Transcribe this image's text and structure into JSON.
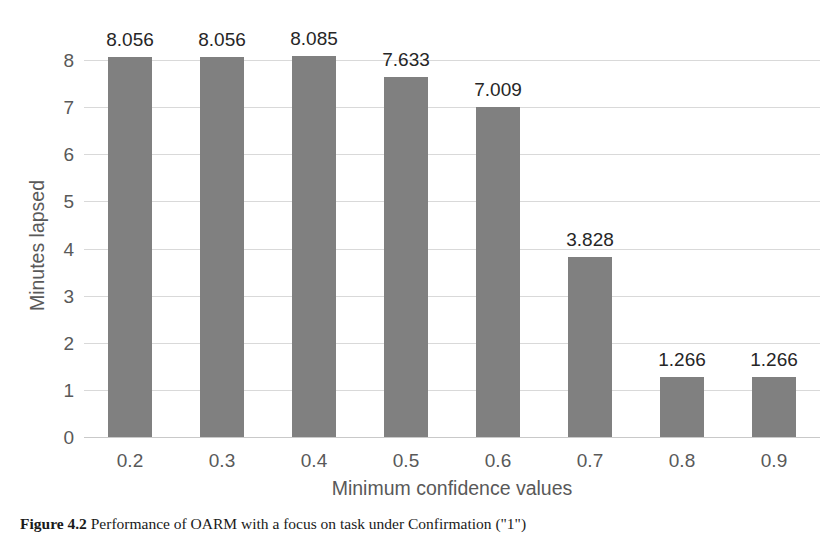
{
  "chart_data": {
    "type": "bar",
    "title": "",
    "categories": [
      "0.2",
      "0.3",
      "0.4",
      "0.5",
      "0.6",
      "0.7",
      "0.8",
      "0.9"
    ],
    "values": [
      8.056,
      8.056,
      8.085,
      7.633,
      7.009,
      3.828,
      1.266,
      1.266
    ],
    "data_labels": [
      "8.056",
      "8.056",
      "8.085",
      "7.633",
      "7.009",
      "3.828",
      "1.266",
      "1.266"
    ],
    "xlabel": "Minimum confidence values",
    "ylabel": "Minutes lapsed",
    "ytick_labels": [
      "0",
      "1",
      "2",
      "3",
      "4",
      "5",
      "6",
      "7",
      "8"
    ],
    "yticks": [
      0,
      1,
      2,
      3,
      4,
      5,
      6,
      7,
      8
    ],
    "ylim": [
      0,
      8
    ],
    "grid": true,
    "legend": "none",
    "bar_color": "#808080",
    "gridline_color": "#d9d9d9",
    "axis_text_color": "#595959",
    "label_text_color": "#262626",
    "background": "#ffffff"
  },
  "caption": {
    "figure_number": "Figure 4.2",
    "text": "Performance of OARM with a focus on task under Confirmation (\"1\")"
  }
}
